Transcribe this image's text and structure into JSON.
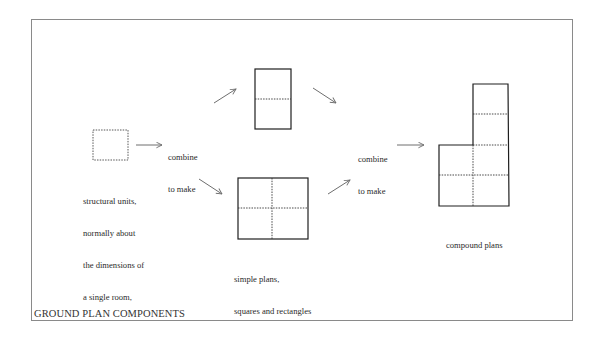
{
  "figure": {
    "caption": "GROUND PLAN COMPONENTS",
    "stages": [
      {
        "id": "structural-unit",
        "shape": "dotted-square",
        "label_lines": [
          "structural units,",
          "normally about",
          "the dimensions of",
          "a single room,"
        ]
      },
      {
        "id": "combine-1",
        "label_lines": [
          "combine",
          "to make"
        ],
        "arrow": "right-arrow"
      },
      {
        "id": "simple-plans",
        "shapes": [
          "double-unit-rectangle",
          "four-unit-square"
        ],
        "label_lines": [
          "simple plans,",
          "squares and rectangles"
        ]
      },
      {
        "id": "combine-2",
        "label_lines": [
          "combine",
          "to make"
        ],
        "arrow": "right-arrow"
      },
      {
        "id": "compound-plans",
        "shape": "L-shaped-compound",
        "label_lines": [
          "compound plans"
        ]
      }
    ],
    "colors": {
      "line": "#1e1e1e",
      "arrow": "#777777",
      "frame": "#8a8a8a"
    }
  },
  "labels": {
    "unit_l1": "structural units,",
    "unit_l2": "normally about",
    "unit_l3": "the dimensions of",
    "unit_l4": "a single room,",
    "combine1_l1": "combine",
    "combine1_l2": "to make",
    "simple_l1": "simple plans,",
    "simple_l2": "squares and rectangles",
    "combine2_l1": "combine",
    "combine2_l2": "to make",
    "compound": "compound plans"
  }
}
